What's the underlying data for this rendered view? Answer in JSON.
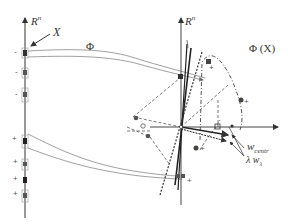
{
  "labels": {
    "input_space": "R",
    "input_space_sup": "n",
    "feature_space": "R",
    "feature_space_sup": "n",
    "set_x": "X",
    "mapping": "Φ",
    "mapped_set": "Φ (X)",
    "w_centr": "w",
    "w_centr_sub": "centr",
    "lambda_w": "λ w",
    "lambda_w_sub": "λ"
  },
  "left_axis_points": [
    {
      "sign": "-",
      "y": 53
    },
    {
      "sign": "-",
      "y": 73
    },
    {
      "sign": "-",
      "y": 95
    },
    {
      "sign": "+",
      "y": 141
    },
    {
      "sign": "+",
      "y": 164
    },
    {
      "sign": "+",
      "y": 181
    },
    {
      "sign": "+",
      "y": 196
    }
  ],
  "colors": {
    "axis": "#333333",
    "curve": "#777777",
    "point_fill": "#333333",
    "dash": "#444444"
  }
}
